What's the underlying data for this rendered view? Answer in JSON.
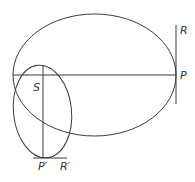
{
  "diagram": {
    "colors": {
      "stroke": "#3a3a3a",
      "background": "#ffffff"
    },
    "labels": {
      "R": "R",
      "P": "P",
      "S": "S",
      "P_prime": "P′",
      "R_prime": "R′"
    }
  }
}
